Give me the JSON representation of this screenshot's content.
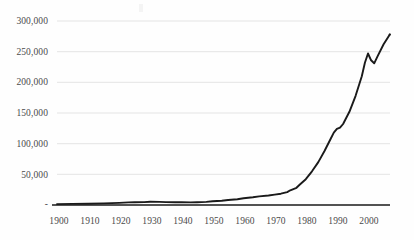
{
  "chart_data": {
    "type": "line",
    "title": "",
    "subtitle": "",
    "xlabel": "",
    "ylabel": "",
    "grid": true,
    "legend": "none",
    "xlim": [
      1900,
      2007
    ],
    "ylim": [
      0,
      300000
    ],
    "ytick_labels": [
      "300,000",
      "250,000",
      "200,000",
      "150,000",
      "100,000",
      "50,000",
      "-"
    ],
    "ytick_values": [
      300000,
      250000,
      200000,
      150000,
      100000,
      50000,
      0
    ],
    "xtick_labels": [
      "1900",
      "1910",
      "1920",
      "1930",
      "1940",
      "1950",
      "1960",
      "1970",
      "1980",
      "1990",
      "2000"
    ],
    "xtick_values": [
      1900,
      1910,
      1920,
      1930,
      1940,
      1950,
      1960,
      1970,
      1980,
      1990,
      2000
    ],
    "series": [
      {
        "name": "series-1",
        "color": "#1a1a1a",
        "x": [
          1900,
          1905,
          1910,
          1915,
          1920,
          1923,
          1925,
          1928,
          1930,
          1933,
          1935,
          1938,
          1940,
          1943,
          1945,
          1948,
          1950,
          1953,
          1955,
          1958,
          1960,
          1963,
          1965,
          1968,
          1970,
          1972,
          1974,
          1975,
          1977,
          1978,
          1980,
          1982,
          1984,
          1986,
          1988,
          1989,
          1990,
          1991,
          1992,
          1994,
          1996,
          1998,
          1999,
          2000,
          2001,
          2002,
          2003,
          2005,
          2007
        ],
        "values": [
          1500,
          1800,
          2200,
          2600,
          3500,
          4200,
          4600,
          4800,
          5200,
          5000,
          4700,
          4500,
          4400,
          4200,
          4500,
          5000,
          6000,
          7000,
          8200,
          9500,
          11000,
          12500,
          14000,
          15500,
          17000,
          18500,
          21000,
          24000,
          28000,
          33000,
          42000,
          55000,
          70000,
          88000,
          108000,
          118000,
          124000,
          126000,
          132000,
          152000,
          178000,
          210000,
          232000,
          247000,
          236000,
          231000,
          242000,
          262000,
          278000
        ]
      }
    ],
    "axis_color": "#1a1a1a",
    "grid_color": "#e4e4e4",
    "background": "#ffffff"
  },
  "axes": {
    "y_labels": [
      {
        "text": "300,000",
        "y": 16
      },
      {
        "text": "250,000",
        "y": 47
      },
      {
        "text": "200,000",
        "y": 77
      },
      {
        "text": "150,000",
        "y": 108
      },
      {
        "text": "100,000",
        "y": 139
      },
      {
        "text": "50,000",
        "y": 170
      },
      {
        "text": "-",
        "y": 198
      }
    ],
    "x_labels": [
      {
        "text": "1900",
        "x": 42
      },
      {
        "text": "1910",
        "x": 73
      },
      {
        "text": "1920",
        "x": 104
      },
      {
        "text": "1930",
        "x": 135
      },
      {
        "text": "1940",
        "x": 166
      },
      {
        "text": "1950",
        "x": 197
      },
      {
        "text": "1960",
        "x": 228
      },
      {
        "text": "1970",
        "x": 259
      },
      {
        "text": "1980",
        "x": 290
      },
      {
        "text": "1990",
        "x": 321
      },
      {
        "text": "2000",
        "x": 352
      }
    ]
  }
}
